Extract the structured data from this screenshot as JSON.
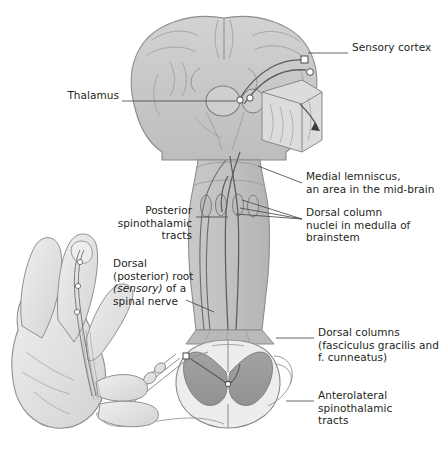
{
  "figure": {
    "type": "anatomical-diagram",
    "background_color": "#ffffff",
    "ink_color": "#231f20",
    "leader_line_color": "#4a4a4a",
    "palette": {
      "brain_fill": "#c9c9c9",
      "brain_stroke": "#8c8c8c",
      "brainstem_fill": "#c2c2c2",
      "cord_white_matter": "#e8e8e8",
      "cord_gray_matter": "#9a9a9a",
      "hand_fill": "#e4e4e4",
      "hand_stroke": "#8f8f8f",
      "tract_dark": "#5d5d5d",
      "tract_mid": "#7b7b7b"
    }
  },
  "labels": [
    {
      "id": "sensory-cortex",
      "text": "Sensory cortex",
      "align": "left",
      "x": 352,
      "y": 47,
      "leader": {
        "x1": 348,
        "y1": 53,
        "x2": 308,
        "y2": 53
      }
    },
    {
      "id": "thalamus",
      "text": "Thalamus",
      "align": "right",
      "x": 19,
      "y": 95,
      "leader": {
        "x1": 122,
        "y1": 101,
        "x2": 236,
        "y2": 101
      }
    },
    {
      "id": "medial-lemniscus",
      "text": "Medial lemniscus,\nan area in the mid-brain",
      "align": "left",
      "x": 306,
      "y": 176,
      "leader": {
        "x1": 302,
        "y1": 183,
        "x2": 258,
        "y2": 166
      }
    },
    {
      "id": "dorsal-column-nuclei",
      "text": "Dorsal column\nnuclei in medulla of\nbrainstem",
      "align": "left",
      "x": 306,
      "y": 212,
      "leader": {
        "x1": 302,
        "y1": 219,
        "x2": 240,
        "y2": 201
      }
    },
    {
      "id": "posterior-spinothalamic",
      "text": "Posterior\nspinothalamic\ntracts",
      "align": "right",
      "x": 124,
      "y": 210,
      "leader": {
        "x1": 196,
        "y1": 217,
        "x2": 228,
        "y2": 217
      }
    },
    {
      "id": "dorsal-root",
      "text": "Dorsal\n(posterior) root\n(sensory) of a\nspinal nerve",
      "align": "left",
      "x": 113,
      "y": 263,
      "italic_line": 2,
      "italic_word": "(sensory)",
      "leader": {
        "x1": 186,
        "y1": 300,
        "x2": 214,
        "y2": 312
      }
    },
    {
      "id": "dorsal-columns",
      "text": "Dorsal columns\n(fasciculus gracilis and\nf. cunneatus)",
      "align": "left",
      "x": 318,
      "y": 332,
      "leader": {
        "x1": 314,
        "y1": 338,
        "x2": 276,
        "y2": 338
      }
    },
    {
      "id": "anterolateral-spinothalamic",
      "text": "Anterolateral\nspinothalamic\ntracts",
      "align": "left",
      "x": 318,
      "y": 395,
      "leader": {
        "x1": 314,
        "y1": 401,
        "x2": 286,
        "y2": 401
      }
    }
  ],
  "structures": {
    "brain": "coronal-brain-section",
    "brainstem": "brainstem-medulla",
    "spinal_cord": "spinal-cord-cross-section",
    "hand": "left-hand-palmar-view",
    "cortex_block": "sensory-cortex-3d-block-inset",
    "dorsal_root_ganglion": "dorsal-root-ganglion"
  },
  "edge_caption": {
    "visible_fragment": "",
    "note": "text clipped at right page edge"
  }
}
